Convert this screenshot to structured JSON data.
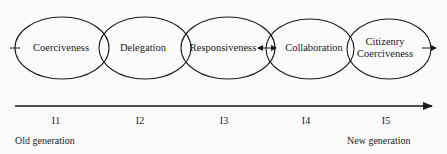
{
  "diagram": {
    "type": "overlapping-ellipse-sequence",
    "stages": [
      {
        "id": "s1",
        "label": "Coerciveness",
        "cx": 62,
        "label_x": 61
      },
      {
        "id": "s2",
        "label": "Delegation",
        "cx": 145,
        "label_x": 143
      },
      {
        "id": "s3",
        "label": "Responsiveness",
        "cx": 228,
        "label_x": 225
      },
      {
        "id": "s4",
        "label": "Collaboration",
        "cx": 310,
        "label_x": 313
      },
      {
        "id": "s5",
        "label": "Citizenry\nCoerciveness",
        "line1": "Citizenry",
        "line2": "Coerciveness",
        "cx": 390,
        "label_x": 386
      }
    ],
    "timeline": {
      "ticks": [
        {
          "label": "I1",
          "x": 56
        },
        {
          "label": "I2",
          "x": 140
        },
        {
          "label": "I3",
          "x": 224
        },
        {
          "label": "I4",
          "x": 306
        },
        {
          "label": "I5",
          "x": 386
        }
      ],
      "start_label": "Old generation",
      "end_label": "New generation"
    },
    "colors": {
      "stroke": "#1a1a1a",
      "background": "#fbfbfb",
      "text": "#1a1a1a"
    }
  }
}
